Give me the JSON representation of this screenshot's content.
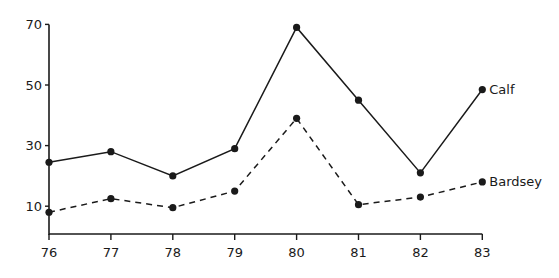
{
  "chart_data": {
    "type": "line",
    "title": "",
    "xlabel": "",
    "ylabel": "",
    "x": [
      "76",
      "77",
      "78",
      "79",
      "80",
      "81",
      "82",
      "83"
    ],
    "series": [
      {
        "name": "Calf",
        "style": "solid",
        "values": [
          24.5,
          28,
          20,
          29,
          69,
          45,
          21,
          48.5
        ]
      },
      {
        "name": "Bardsey",
        "style": "dashed",
        "values": [
          8,
          12.5,
          9.5,
          15,
          39,
          10.5,
          13,
          18
        ]
      }
    ],
    "yticks": [
      10,
      30,
      50,
      70
    ],
    "ylim": [
      0,
      72
    ],
    "grid": false,
    "legend_position": "inline at line ends (right)"
  },
  "colors": {
    "line": "#1a1a1a",
    "background": "#ffffff"
  }
}
